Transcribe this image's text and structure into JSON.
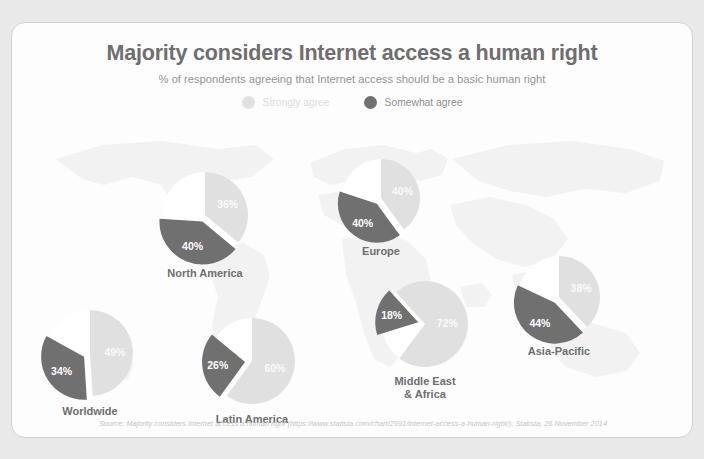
{
  "header": {
    "title": "Majority considers Internet access a human right",
    "subtitle": "% of respondents agreeing that Internet access should be a basic human right"
  },
  "legend": {
    "position": "top-center",
    "items": [
      {
        "label": "Strongly agree",
        "color": "#e0e0e0",
        "key": "strongly_agree"
      },
      {
        "label": "Somewhat agree",
        "color": "#707070",
        "key": "somewhat_agree"
      }
    ]
  },
  "footer": {
    "source": "Source: Majority considers Internet access a human right (https://www.statista.com/chart/2991/internet-access-a-human-right/), Statista, 26 November 2014"
  },
  "colors": {
    "strongly_agree": "#e0e0e0",
    "somewhat_agree": "#707070",
    "empty": "#ffffff",
    "map": "#ededed",
    "title": "#6e6e6e",
    "subtitle": "#949494",
    "card_bg": "#fdfdfd",
    "page_bg": "#e9e9e9"
  },
  "chart_data": {
    "type": "pie",
    "title": "Majority considers Internet access a human right",
    "subtitle": "% of respondents agreeing that Internet access should be a basic human right",
    "unit": "%",
    "series": [
      {
        "name": "Strongly agree",
        "color": "#e0e0e0"
      },
      {
        "name": "Somewhat agree",
        "color": "#707070"
      }
    ],
    "categories": [
      "Worldwide",
      "North America",
      "Latin America",
      "Europe",
      "Middle East & Africa",
      "Asia-Pacific"
    ],
    "pies": [
      {
        "id": "worldwide",
        "region": "Worldwide",
        "label_lines": [
          "Worldwide"
        ],
        "cx": 78,
        "cy": 330,
        "r": 43,
        "slices": [
          {
            "series": "Strongly agree",
            "value": 49,
            "display": "49%",
            "color": "#e0e0e0",
            "start_deg": 0,
            "end_deg": 176.4,
            "exploded": false,
            "label_r": 0.58
          },
          {
            "series": "Somewhat agree",
            "value": 34,
            "display": "34%",
            "color": "#707070",
            "start_deg": 176.4,
            "end_deg": 298.8,
            "exploded": true,
            "label_r": 0.62
          }
        ],
        "label_x": 78,
        "label_y": 382
      },
      {
        "id": "north-america",
        "region": "North America",
        "label_lines": [
          "North America"
        ],
        "cx": 193,
        "cy": 192,
        "r": 43,
        "slices": [
          {
            "series": "Strongly agree",
            "value": 36,
            "display": "36%",
            "color": "#e0e0e0",
            "start_deg": 0,
            "end_deg": 129.6,
            "exploded": false,
            "label_r": 0.58
          },
          {
            "series": "Somewhat agree",
            "value": 40,
            "display": "40%",
            "color": "#707070",
            "start_deg": 129.6,
            "end_deg": 273.6,
            "exploded": true,
            "label_r": 0.62
          }
        ],
        "label_x": 193,
        "label_y": 244
      },
      {
        "id": "latin-america",
        "region": "Latin America",
        "label_lines": [
          "Latin America"
        ],
        "cx": 240,
        "cy": 338,
        "r": 43,
        "slices": [
          {
            "series": "Strongly agree",
            "value": 60,
            "display": "60%",
            "color": "#e0e0e0",
            "start_deg": 0,
            "end_deg": 216,
            "exploded": false,
            "label_r": 0.56
          },
          {
            "series": "Somewhat agree",
            "value": 26,
            "display": "26%",
            "color": "#707070",
            "start_deg": 216,
            "end_deg": 309.6,
            "exploded": true,
            "label_r": 0.64
          }
        ],
        "label_x": 240,
        "label_y": 390
      },
      {
        "id": "europe",
        "region": "Europe",
        "label_lines": [
          "Europe"
        ],
        "cx": 369,
        "cy": 175,
        "r": 39,
        "slices": [
          {
            "series": "Strongly agree",
            "value": 40,
            "display": "40%",
            "color": "#e0e0e0",
            "start_deg": 0,
            "end_deg": 144,
            "exploded": false,
            "label_r": 0.58
          },
          {
            "series": "Somewhat agree",
            "value": 40,
            "display": "40%",
            "color": "#707070",
            "start_deg": 144,
            "end_deg": 288,
            "exploded": true,
            "label_r": 0.62
          }
        ],
        "label_x": 369,
        "label_y": 222
      },
      {
        "id": "middle-east-africa",
        "region": "Middle East & Africa",
        "label_lines": [
          "Middle East",
          "& Africa"
        ],
        "cx": 413,
        "cy": 301,
        "r": 43,
        "slices": [
          {
            "series": "Somewhat agree",
            "value": 18,
            "display": "18%",
            "color": "#707070",
            "start_deg": 252.8,
            "end_deg": 317.6,
            "exploded": true,
            "label_r": 0.64
          },
          {
            "series": "Strongly agree",
            "value": 72,
            "display": "72%",
            "color": "#e0e0e0",
            "start_deg": 317.6,
            "end_deg": 576.8,
            "exploded": false,
            "label_r": 0.52
          }
        ],
        "label_x": 413,
        "label_y": 352
      },
      {
        "id": "asia-pacific",
        "region": "Asia-Pacific",
        "label_lines": [
          "Asia-Pacific"
        ],
        "cx": 547,
        "cy": 274,
        "r": 41,
        "slices": [
          {
            "series": "Strongly agree",
            "value": 38,
            "display": "38%",
            "color": "#e0e0e0",
            "start_deg": 0,
            "end_deg": 136.8,
            "exploded": false,
            "label_r": 0.58
          },
          {
            "series": "Somewhat agree",
            "value": 44,
            "display": "44%",
            "color": "#707070",
            "start_deg": 136.8,
            "end_deg": 295.2,
            "exploded": true,
            "label_r": 0.62
          }
        ],
        "label_x": 547,
        "label_y": 322
      }
    ]
  }
}
